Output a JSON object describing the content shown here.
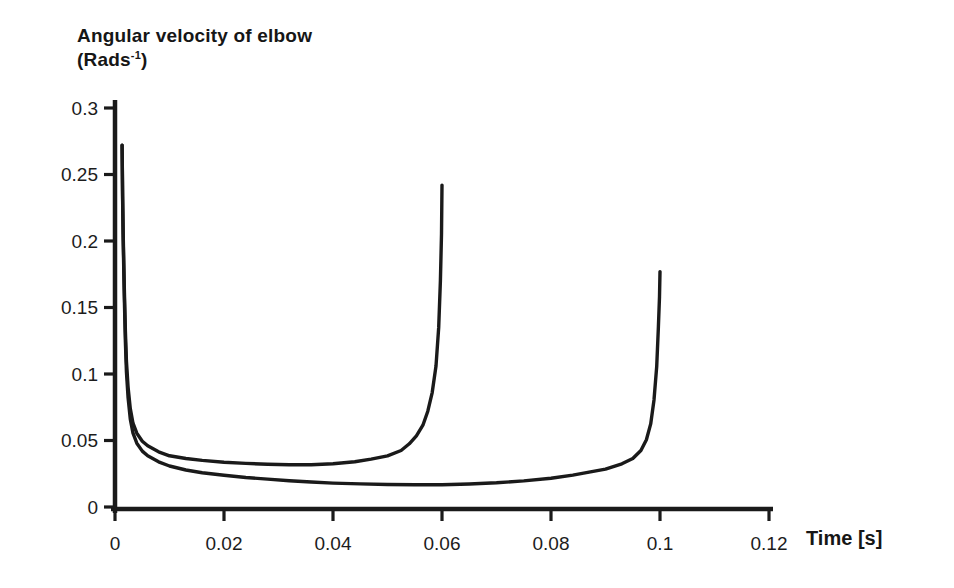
{
  "figure": {
    "y_axis_title": {
      "line1": "Angular velocity of elbow",
      "unit_open": "(Rads",
      "unit_sup": "-1",
      "unit_close": ")"
    },
    "x_axis_title": "Time [s]",
    "colors": {
      "line": "#1a1a1a",
      "axis": "#1a1a1a",
      "text": "#1c1c1c",
      "background": "#ffffff"
    }
  },
  "chart_data": {
    "type": "line",
    "title": "Angular velocity of elbow (Rads-1)",
    "xlabel": "Time [s]",
    "ylabel": "Angular velocity of elbow (Rads-1)",
    "xlim": [
      0,
      0.12
    ],
    "ylim": [
      0,
      0.3
    ],
    "x_ticks": [
      0,
      0.02,
      0.04,
      0.06,
      0.08,
      0.1,
      0.12
    ],
    "x_tick_labels": [
      "0",
      "0.02",
      "0.04",
      "0.06",
      "0.08",
      "0.1",
      "0.12"
    ],
    "y_ticks": [
      0,
      0.05,
      0.1,
      0.15,
      0.2,
      0.25,
      0.3
    ],
    "y_tick_labels": [
      "0",
      "0.05",
      "0.1",
      "0.15",
      "0.2",
      "0.25",
      "0.3"
    ],
    "grid": false,
    "legend": "none",
    "series": [
      {
        "name": "fast-movement-curve-ending-0.06s",
        "start": [
          0.0013,
          0.272
        ],
        "end": [
          0.06,
          0.242
        ],
        "min_value": 0.032,
        "points": [
          [
            0.0013,
            0.272
          ],
          [
            0.0014,
            0.235
          ],
          [
            0.0015,
            0.205
          ],
          [
            0.0017,
            0.165
          ],
          [
            0.0019,
            0.132
          ],
          [
            0.0021,
            0.11
          ],
          [
            0.0024,
            0.09
          ],
          [
            0.0028,
            0.074
          ],
          [
            0.0033,
            0.063
          ],
          [
            0.004,
            0.0555
          ],
          [
            0.005,
            0.0495
          ],
          [
            0.006,
            0.046
          ],
          [
            0.008,
            0.0415
          ],
          [
            0.01,
            0.0385
          ],
          [
            0.013,
            0.0365
          ],
          [
            0.016,
            0.035
          ],
          [
            0.02,
            0.0337
          ],
          [
            0.024,
            0.0328
          ],
          [
            0.028,
            0.0322
          ],
          [
            0.032,
            0.0318
          ],
          [
            0.036,
            0.0318
          ],
          [
            0.04,
            0.0325
          ],
          [
            0.044,
            0.034
          ],
          [
            0.047,
            0.036
          ],
          [
            0.05,
            0.0385
          ],
          [
            0.0525,
            0.0425
          ],
          [
            0.054,
            0.0475
          ],
          [
            0.0553,
            0.0535
          ],
          [
            0.0565,
            0.0615
          ],
          [
            0.0574,
            0.072
          ],
          [
            0.0582,
            0.086
          ],
          [
            0.0589,
            0.106
          ],
          [
            0.0594,
            0.135
          ],
          [
            0.0597,
            0.17
          ],
          [
            0.0599,
            0.205
          ],
          [
            0.06,
            0.242
          ]
        ]
      },
      {
        "name": "slow-movement-curve-ending-0.1s",
        "start": [
          0.0013,
          0.272
        ],
        "end": [
          0.1,
          0.177
        ],
        "min_value": 0.017,
        "points": [
          [
            0.0013,
            0.272
          ],
          [
            0.0014,
            0.232
          ],
          [
            0.0015,
            0.2
          ],
          [
            0.0017,
            0.158
          ],
          [
            0.0019,
            0.124
          ],
          [
            0.0021,
            0.102
          ],
          [
            0.0024,
            0.082
          ],
          [
            0.0028,
            0.066
          ],
          [
            0.0033,
            0.0555
          ],
          [
            0.004,
            0.048
          ],
          [
            0.005,
            0.042
          ],
          [
            0.006,
            0.0385
          ],
          [
            0.008,
            0.034
          ],
          [
            0.01,
            0.0308
          ],
          [
            0.013,
            0.0278
          ],
          [
            0.016,
            0.0258
          ],
          [
            0.02,
            0.0238
          ],
          [
            0.024,
            0.0222
          ],
          [
            0.028,
            0.021
          ],
          [
            0.032,
            0.0198
          ],
          [
            0.036,
            0.0188
          ],
          [
            0.04,
            0.018
          ],
          [
            0.045,
            0.0174
          ],
          [
            0.05,
            0.0169
          ],
          [
            0.055,
            0.0167
          ],
          [
            0.06,
            0.0168
          ],
          [
            0.065,
            0.0173
          ],
          [
            0.07,
            0.0182
          ],
          [
            0.075,
            0.0196
          ],
          [
            0.08,
            0.0216
          ],
          [
            0.084,
            0.024
          ],
          [
            0.087,
            0.0262
          ],
          [
            0.09,
            0.0285
          ],
          [
            0.093,
            0.0325
          ],
          [
            0.095,
            0.0365
          ],
          [
            0.0965,
            0.0425
          ],
          [
            0.0975,
            0.0505
          ],
          [
            0.0983,
            0.0625
          ],
          [
            0.0989,
            0.0805
          ],
          [
            0.0994,
            0.1055
          ],
          [
            0.0997,
            0.1355
          ],
          [
            0.0999,
            0.158
          ],
          [
            0.1,
            0.177
          ]
        ]
      }
    ]
  }
}
